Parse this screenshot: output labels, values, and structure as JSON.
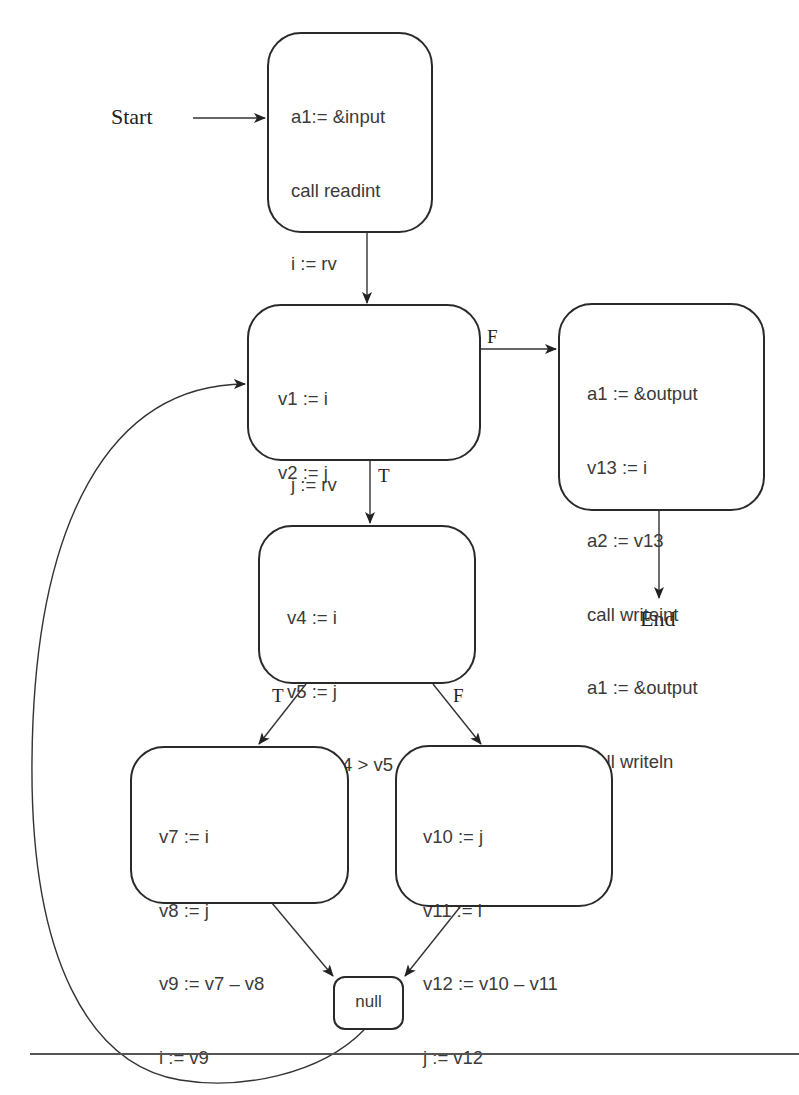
{
  "diagram": {
    "type": "control-flow-graph",
    "start_label": "Start",
    "end_label": "End",
    "nodes": {
      "entry": {
        "lines": [
          "a1:= &input",
          "call readint",
          "i := rv",
          "a1 := &input",
          "call readint",
          "j := rv"
        ]
      },
      "loop_test": {
        "lines": [
          "v1 := i",
          "v2 := j",
          "v3 := v1 <> v2",
          "test v3"
        ]
      },
      "exit": {
        "lines": [
          "a1 := &output",
          "v13 := i",
          "a2 := v13",
          "call writeint",
          "a1 := &output",
          "call writeln"
        ]
      },
      "compare": {
        "lines": [
          "v4 := i",
          "v5 := j",
          "v6 := v4 > v5",
          "test v6"
        ]
      },
      "then_branch": {
        "lines": [
          "v7 := i",
          "v8 := j",
          "v9 := v7 – v8",
          "i := v9"
        ]
      },
      "else_branch": {
        "lines": [
          "v10 := j",
          "v11 := i",
          "v12 := v10 – v11",
          "j := v12"
        ]
      },
      "join": {
        "label": "null"
      }
    },
    "edge_labels": {
      "loop_false": "F",
      "loop_true": "T",
      "compare_true": "T",
      "compare_false": "F"
    },
    "edges": [
      {
        "from": "Start",
        "to": "entry"
      },
      {
        "from": "entry",
        "to": "loop_test"
      },
      {
        "from": "loop_test",
        "to": "exit",
        "label": "F"
      },
      {
        "from": "loop_test",
        "to": "compare",
        "label": "T"
      },
      {
        "from": "exit",
        "to": "End"
      },
      {
        "from": "compare",
        "to": "then_branch",
        "label": "T"
      },
      {
        "from": "compare",
        "to": "else_branch",
        "label": "F"
      },
      {
        "from": "then_branch",
        "to": "join"
      },
      {
        "from": "else_branch",
        "to": "join"
      },
      {
        "from": "join",
        "to": "loop_test"
      }
    ]
  }
}
